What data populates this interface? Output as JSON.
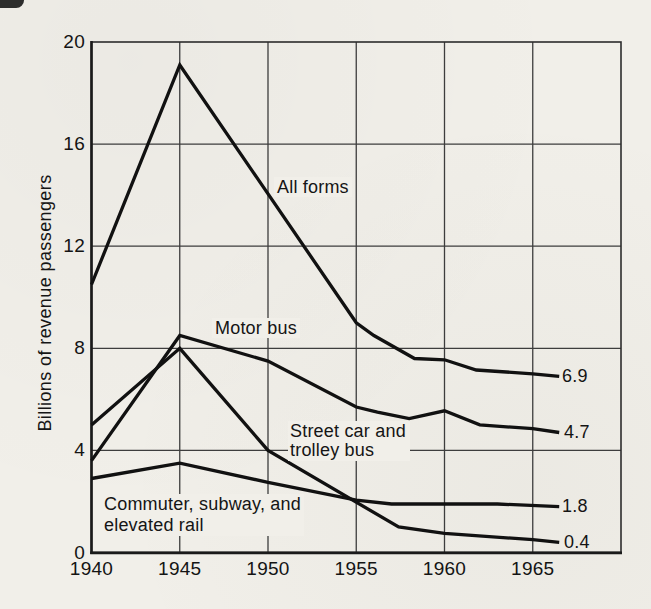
{
  "page": {
    "background": "#f1efe9",
    "ink": "#141414",
    "grid_color": "#3d3d3d",
    "line_color": "#111111"
  },
  "chart_data": {
    "type": "line",
    "title": "",
    "xlabel": "",
    "ylabel": "Billions of revenue passengers",
    "xlim": [
      1940,
      1970
    ],
    "ylim": [
      0,
      20
    ],
    "x_ticks": [
      1940,
      1945,
      1950,
      1955,
      1960,
      1965
    ],
    "y_ticks": [
      0,
      4,
      8,
      12,
      16,
      20
    ],
    "grid": true,
    "legend_position": "inline-labels",
    "series": [
      {
        "name": "All forms",
        "end_label": "6.9",
        "points": [
          [
            1940,
            10.5
          ],
          [
            1945,
            19.1
          ],
          [
            1955,
            9.0
          ],
          [
            1956,
            8.5
          ],
          [
            1958.3,
            7.6
          ],
          [
            1960,
            7.55
          ],
          [
            1961.8,
            7.15
          ],
          [
            1965,
            7.0
          ],
          [
            1966.5,
            6.9
          ]
        ]
      },
      {
        "name": "Motor bus",
        "end_label": "4.7",
        "points": [
          [
            1940,
            3.6
          ],
          [
            1945,
            8.5
          ],
          [
            1950,
            7.5
          ],
          [
            1955,
            5.7
          ],
          [
            1956.2,
            5.5
          ],
          [
            1958,
            5.25
          ],
          [
            1960,
            5.55
          ],
          [
            1962,
            5.0
          ],
          [
            1965,
            4.85
          ],
          [
            1966.5,
            4.7
          ]
        ]
      },
      {
        "name": "Street car and trolley bus",
        "end_label": "0.4",
        "points": [
          [
            1940,
            5.0
          ],
          [
            1945,
            8.0
          ],
          [
            1950,
            4.0
          ],
          [
            1957.4,
            1.0
          ],
          [
            1960,
            0.75
          ],
          [
            1965,
            0.5
          ],
          [
            1966.5,
            0.4
          ]
        ]
      },
      {
        "name": "Commuter, subway, and elevated rail",
        "end_label": "1.8",
        "points": [
          [
            1940,
            2.9
          ],
          [
            1945,
            3.5
          ],
          [
            1950,
            2.75
          ],
          [
            1955,
            2.05
          ],
          [
            1957,
            1.9
          ],
          [
            1963,
            1.9
          ],
          [
            1966.5,
            1.8
          ]
        ]
      }
    ]
  },
  "labels": {
    "all_forms": "All forms",
    "motor_bus": "Motor bus",
    "street_car_line1": "Street car and",
    "street_car_line2": "trolley bus",
    "commuter_line1": "Commuter, subway, and",
    "commuter_line2": "elevated rail",
    "end_all_forms": "6.9",
    "end_motor_bus": "4.7",
    "end_commuter": "1.8",
    "end_street_car": "0.4",
    "y_axis_title": "Billions of revenue passengers"
  }
}
